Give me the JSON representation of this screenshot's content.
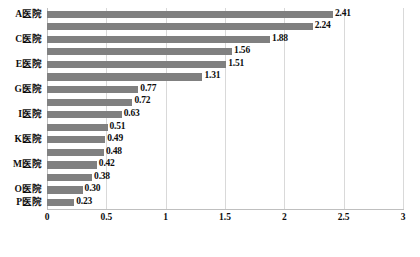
{
  "chart_data": {
    "type": "bar",
    "orientation": "horizontal",
    "title": "",
    "xlabel": "",
    "ylabel": "",
    "xlim": [
      0,
      3
    ],
    "xticks": [
      "0",
      "0.5",
      "1",
      "1.5",
      "2",
      "2.5",
      "3"
    ],
    "xtick_values": [
      0,
      0.5,
      1,
      1.5,
      2,
      2.5,
      3
    ],
    "grid": true,
    "legend": false,
    "bar_color": "#808080",
    "gridline_color": "#d9d9d9",
    "categories": [
      "A医院",
      "B医院",
      "C医院",
      "D医院",
      "E医院",
      "F医院",
      "G医院",
      "H医院",
      "I医院",
      "J医院",
      "K医院",
      "L医院",
      "M医院",
      "N医院",
      "O医院",
      "P医院"
    ],
    "category_labels_visible": [
      "A医院",
      "",
      "C医院",
      "",
      "E医院",
      "",
      "G医院",
      "",
      "I医院",
      "",
      "K医院",
      "",
      "M医院",
      "",
      "O医院",
      "P医院"
    ],
    "values": [
      2.41,
      2.24,
      1.88,
      1.56,
      1.51,
      1.31,
      0.77,
      0.72,
      0.63,
      0.51,
      0.49,
      0.48,
      0.42,
      0.38,
      0.3,
      0.23
    ],
    "data_labels": [
      "2.41",
      "2.24",
      "1.88",
      "1.56",
      "1.51",
      "1.31",
      "0.77",
      "0.72",
      "0.63",
      "0.51",
      "0.49",
      "0.48",
      "0.42",
      "0.38",
      "0.30",
      "0.23"
    ],
    "extra_bottom_bar": {
      "label": "0.23",
      "value": 0.23
    }
  },
  "caption": {
    "text": ""
  }
}
